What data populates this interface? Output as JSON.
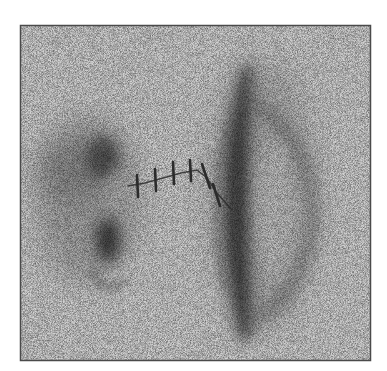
{
  "figure": {
    "colors": {
      "page_background": "#ffffff",
      "panel_background": "#cfcfcf",
      "frame": "#4a4a4a",
      "dark_feature": "#2a2a2a",
      "stitch": "#2b2b2b"
    },
    "frame": {
      "x": 20,
      "y": 25,
      "width": 351,
      "height": 336
    },
    "features": [
      {
        "name": "left-blob",
        "shape": "diffuse irregular cloud with dark core at top and dark knot at bottom"
      },
      {
        "name": "right-lens",
        "shape": "elongated vertical lens with dark left rim and lighter interior"
      },
      {
        "name": "stitched-bridge",
        "stitch_count": 6
      }
    ],
    "stitches": [
      {
        "x1": 137,
        "y1": 175,
        "x2": 138,
        "y2": 197
      },
      {
        "x1": 155,
        "y1": 169,
        "x2": 156,
        "y2": 191
      },
      {
        "x1": 173,
        "y1": 162,
        "x2": 174,
        "y2": 184
      },
      {
        "x1": 190,
        "y1": 160,
        "x2": 191,
        "y2": 181
      },
      {
        "x1": 202,
        "y1": 164,
        "x2": 210,
        "y2": 188
      },
      {
        "x1": 213,
        "y1": 184,
        "x2": 220,
        "y2": 206
      }
    ],
    "thread": "M128,186 L145,183 L163,178 L181,173 L197,170 L207,178 L216,192 L232,210"
  }
}
